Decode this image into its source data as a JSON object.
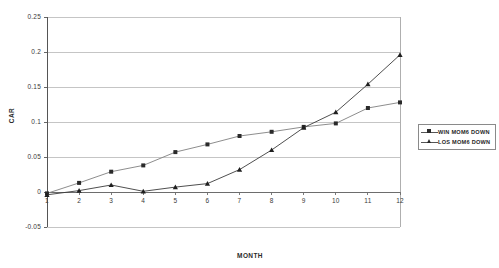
{
  "chart_data": {
    "type": "line",
    "title": "",
    "xlabel": "MONTH",
    "ylabel": "CAR",
    "x": [
      1,
      2,
      3,
      4,
      5,
      6,
      7,
      8,
      9,
      10,
      11,
      12
    ],
    "xtick_labels": [
      "1",
      "2",
      "3",
      "4",
      "5",
      "6",
      "7",
      "8",
      "9",
      "10",
      "11",
      "12"
    ],
    "ytick_labels": [
      "0.25",
      "0.2",
      "0.15",
      "0.1",
      "0.05",
      "0",
      "-0.05"
    ],
    "ytick_values": [
      0.25,
      0.2,
      0.15,
      0.1,
      0.05,
      0,
      -0.05
    ],
    "ylim": [
      -0.05,
      0.25
    ],
    "xlim": [
      1,
      12
    ],
    "grid": "horizontal",
    "legend_position": "right-outside",
    "series": [
      {
        "name": "WIN MOM6 DOWN",
        "marker": "square",
        "color": "#808080",
        "values": [
          -0.002,
          0.013,
          0.029,
          0.038,
          0.057,
          0.068,
          0.08,
          0.086,
          0.093,
          0.098,
          0.12,
          0.128
        ]
      },
      {
        "name": "LOS MOM6 DOWN",
        "marker": "triangle",
        "color": "#3b3b3b",
        "values": [
          -0.004,
          0.002,
          0.01,
          0.001,
          0.007,
          0.012,
          0.032,
          0.06,
          0.092,
          0.114,
          0.154,
          0.196
        ]
      }
    ]
  },
  "legend": {
    "items": [
      {
        "label": "WIN MOM6 DOWN",
        "marker": "square"
      },
      {
        "label": "LOS MOM6 DOWN",
        "marker": "triangle"
      }
    ]
  }
}
